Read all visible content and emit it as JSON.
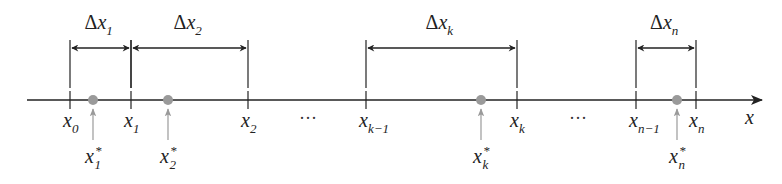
{
  "diagram": {
    "type": "partition-number-line",
    "axis": {
      "label": "x",
      "y": 100,
      "x_start": 27,
      "x_end": 762
    },
    "colors": {
      "line": "#222222",
      "point": "#9a9a9a",
      "arrow_gray": "#9a9a9a",
      "text": "#222222"
    },
    "ticks": [
      {
        "id": "x0",
        "x": 70,
        "base": "x",
        "sub": "0"
      },
      {
        "id": "x1",
        "x": 131,
        "base": "x",
        "sub": "1"
      },
      {
        "id": "x2",
        "x": 248,
        "base": "x",
        "sub": "2"
      },
      {
        "id": "xk-1",
        "x": 366,
        "base": "x",
        "sub": "k−1"
      },
      {
        "id": "xk",
        "x": 517,
        "base": "x",
        "sub": "k"
      },
      {
        "id": "xn-1",
        "x": 636,
        "base": "x",
        "sub": "n−1"
      },
      {
        "id": "xn",
        "x": 696,
        "base": "x",
        "sub": "n"
      }
    ],
    "ellipses": [
      {
        "x": 308,
        "text": "···"
      },
      {
        "x": 578,
        "text": "···"
      }
    ],
    "sample_points": [
      {
        "x": 93,
        "base": "x",
        "sub": "1",
        "sup": "*"
      },
      {
        "x": 168,
        "base": "x",
        "sub": "2",
        "sup": "*"
      },
      {
        "x": 481,
        "base": "x",
        "sub": "k",
        "sup": "*"
      },
      {
        "x": 677,
        "base": "x",
        "sub": "n",
        "sup": "*"
      }
    ],
    "intervals": [
      {
        "from": 70,
        "to": 131,
        "label_prefix": "Δ",
        "base": "x",
        "sub": "1"
      },
      {
        "from": 131,
        "to": 248,
        "label_prefix": "Δ",
        "base": "x",
        "sub": "2"
      },
      {
        "from": 366,
        "to": 517,
        "label_prefix": "Δ",
        "base": "x",
        "sub": "k"
      },
      {
        "from": 636,
        "to": 696,
        "label_prefix": "Δ",
        "base": "x",
        "sub": "n"
      }
    ]
  }
}
